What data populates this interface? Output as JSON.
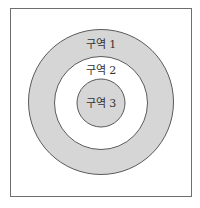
{
  "diagram": {
    "type": "concentric-zones",
    "frame": {
      "stroke": "#6e6e6e"
    },
    "colors": {
      "shaded": "#d6d6d6",
      "unshaded": "#ffffff",
      "stroke": "#5a5a5a",
      "text": "#333333"
    },
    "zones": [
      {
        "id": 1,
        "label": "구역 1",
        "fill": "shaded"
      },
      {
        "id": 2,
        "label": "구역 2",
        "fill": "unshaded"
      },
      {
        "id": 3,
        "label": "구역 3",
        "fill": "shaded"
      }
    ]
  }
}
